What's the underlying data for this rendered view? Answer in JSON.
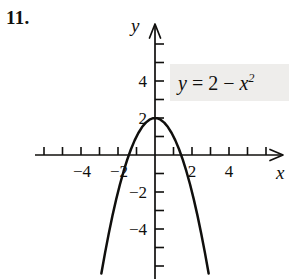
{
  "problem": {
    "number": "11."
  },
  "equation": {
    "lhs": "y",
    "eq": "=",
    "constant": "2",
    "minus": "−",
    "base": "x",
    "exponent": "2",
    "plain": "y = 2 − x²",
    "box_color": "#eeedeb"
  },
  "axes": {
    "x_name": "x",
    "y_name": "y",
    "axis_color": "#100f0d"
  },
  "chart_data": {
    "type": "line",
    "title": "",
    "subtitle": "",
    "xlabel": "x",
    "ylabel": "y",
    "equation": "y = 2 - x^2",
    "curve_color": "#100f0d",
    "grid": false,
    "legend": "none",
    "annotations": [
      {
        "text": "y = 2 − x²",
        "x": 3.2,
        "y": 3.1,
        "style": "gray-box-label"
      }
    ],
    "xlim": [
      -6.5,
      7.0
    ],
    "ylim": [
      -6.2,
      5.8
    ],
    "x_ticks": [
      -5,
      -4,
      -3,
      -2,
      -1,
      1,
      2,
      3,
      4,
      5,
      6
    ],
    "x_tick_labels": [
      {
        "value": -4,
        "label": "−4"
      },
      {
        "value": -2,
        "label": "−2"
      },
      {
        "value": 2,
        "label": "2"
      },
      {
        "value": 4,
        "label": "4"
      }
    ],
    "y_ticks": [
      -5,
      -4,
      -3,
      -2,
      -1,
      1,
      2,
      3,
      4,
      5
    ],
    "y_tick_labels": [
      {
        "value": 4,
        "label": "4"
      },
      {
        "value": 2,
        "label": "2"
      },
      {
        "value": -2,
        "label": "−2"
      },
      {
        "value": -4,
        "label": "−4"
      }
    ],
    "vertex": {
      "x": 0,
      "y": 2
    },
    "x_intercepts": [
      -1.414,
      1.414
    ],
    "y_intercept": 2,
    "x": [
      -2.9,
      -2.7,
      -2.5,
      -2.3,
      -2.1,
      -1.9,
      -1.7,
      -1.5,
      -1.3,
      -1.1,
      -0.9,
      -0.7,
      -0.5,
      -0.3,
      -0.1,
      0.1,
      0.3,
      0.5,
      0.7,
      0.9,
      1.1,
      1.3,
      1.5,
      1.7,
      1.9,
      2.1,
      2.3,
      2.5,
      2.7,
      2.9
    ],
    "values": [
      -6.41,
      -5.29,
      -4.25,
      -3.29,
      -2.41,
      -1.61,
      -0.89,
      -0.25,
      0.31,
      0.79,
      1.19,
      1.51,
      1.75,
      1.91,
      1.99,
      1.99,
      1.91,
      1.75,
      1.51,
      1.19,
      0.79,
      0.31,
      -0.25,
      -0.89,
      -1.61,
      -2.41,
      -3.29,
      -4.25,
      -5.29,
      -6.41
    ]
  }
}
